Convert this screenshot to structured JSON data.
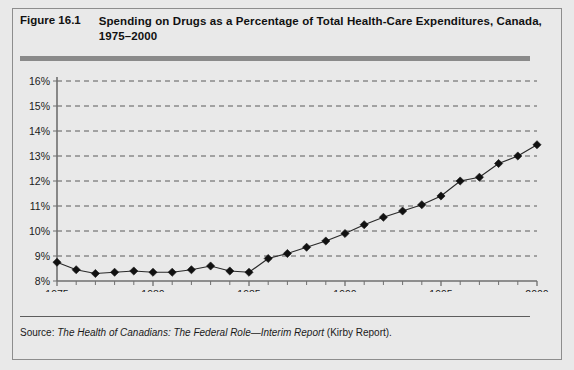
{
  "figure": {
    "number": "Figure 16.1",
    "title": "Spending on Drugs as a Percentage of Total Health-Care Expenditures, Canada, 1975–2000",
    "source_label": "Source:",
    "source_title": "The Health of Canadians: The Federal Role—Interim Report",
    "source_suffix": "(Kirby Report).",
    "colors": {
      "background": "#e9e9e9",
      "border": "#8d8d8d",
      "rule": "#8a8a8a",
      "axis": "#6f6f6f",
      "gridline": "#5a5a5a",
      "marker": "#111111",
      "line": "#2a2a2a",
      "text": "#1a1a1a"
    }
  },
  "chart_data": {
    "type": "line",
    "title": "Spending on Drugs as a Percentage of Total Health-Care Expenditures, Canada, 1975–2000",
    "xlabel": "",
    "ylabel": "",
    "xlim": [
      1975,
      2000
    ],
    "ylim": [
      8,
      16
    ],
    "grid": true,
    "legend": "none",
    "marker": "diamond",
    "ytick_labels": [
      "8%",
      "9%",
      "10%",
      "11%",
      "12%",
      "13%",
      "14%",
      "15%",
      "16%"
    ],
    "ytick_values": [
      8,
      9,
      10,
      11,
      12,
      13,
      14,
      15,
      16
    ],
    "xtick_labels": [
      "1975",
      "1980",
      "1985",
      "1990",
      "1995",
      "2000"
    ],
    "xtick_values": [
      1975,
      1980,
      1985,
      1990,
      1995,
      2000
    ],
    "xtick_minor_values": [
      1976,
      1977,
      1978,
      1979,
      1981,
      1982,
      1983,
      1984,
      1986,
      1987,
      1988,
      1989,
      1991,
      1992,
      1993,
      1994,
      1996,
      1997,
      1998,
      1999
    ],
    "x": [
      1975,
      1976,
      1977,
      1978,
      1979,
      1980,
      1981,
      1982,
      1983,
      1984,
      1985,
      1986,
      1987,
      1988,
      1989,
      1990,
      1991,
      1992,
      1993,
      1994,
      1995,
      1996,
      1997,
      1998,
      1999,
      2000
    ],
    "values": [
      8.75,
      8.45,
      8.3,
      8.35,
      8.4,
      8.35,
      8.35,
      8.45,
      8.6,
      8.4,
      8.35,
      8.9,
      9.1,
      9.35,
      9.6,
      9.9,
      10.25,
      10.55,
      10.8,
      11.05,
      11.4,
      12.0,
      12.15,
      12.7,
      13.0,
      13.45
    ],
    "series": [
      {
        "name": "Drug spending share of total health-care expenditures",
        "values": [
          8.75,
          8.45,
          8.3,
          8.35,
          8.4,
          8.35,
          8.35,
          8.45,
          8.6,
          8.4,
          8.35,
          8.9,
          9.1,
          9.35,
          9.6,
          9.9,
          10.25,
          10.55,
          10.8,
          11.05,
          11.4,
          12.0,
          12.15,
          12.7,
          13.0,
          13.45
        ]
      }
    ]
  }
}
